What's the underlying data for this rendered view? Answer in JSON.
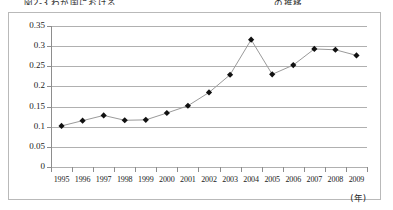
{
  "figure": {
    "caption": "図2-3 わが国における　　　　　　　　　　　　　　　　　の推移",
    "unit_label": "(年)"
  },
  "chart_data": {
    "type": "line",
    "title": "",
    "subtitle": "",
    "xlabel": "(年)",
    "ylabel": "",
    "categories": [
      "1995",
      "1996",
      "1997",
      "1998",
      "1999",
      "2000",
      "2001",
      "2002",
      "2003",
      "2004",
      "2005",
      "2006",
      "2007",
      "2008",
      "2009"
    ],
    "values": [
      0.102,
      0.115,
      0.128,
      0.116,
      0.117,
      0.134,
      0.152,
      0.185,
      0.229,
      0.316,
      0.23,
      0.253,
      0.293,
      0.291,
      0.277
    ],
    "series": [
      {
        "name": "series-1",
        "values": [
          0.102,
          0.115,
          0.128,
          0.116,
          0.117,
          0.134,
          0.152,
          0.185,
          0.229,
          0.316,
          0.23,
          0.253,
          0.293,
          0.291,
          0.277
        ]
      }
    ],
    "ylim": [
      0,
      0.35
    ],
    "yticks": [
      0,
      0.05,
      0.1,
      0.15,
      0.2,
      0.25,
      0.3,
      0.35
    ],
    "ytick_labels": [
      "0",
      "0.05",
      "0.1",
      "0.15",
      "0.2",
      "0.25",
      "0.3",
      "0.35"
    ],
    "xticks": [
      "1995",
      "1996",
      "1997",
      "1998",
      "1999",
      "2000",
      "2001",
      "2002",
      "2003",
      "2004",
      "2005",
      "2006",
      "2007",
      "2008",
      "2009"
    ],
    "grid": true,
    "legend": false,
    "legend_position": "none",
    "marker": "diamond",
    "marker_color": "#111111",
    "line_color": "#9a9a9a",
    "gridline_color": "#b0b0b0",
    "axis_color": "#8d8d8d",
    "background_color": "#ffffff",
    "border_color": "#b9b9b9"
  }
}
